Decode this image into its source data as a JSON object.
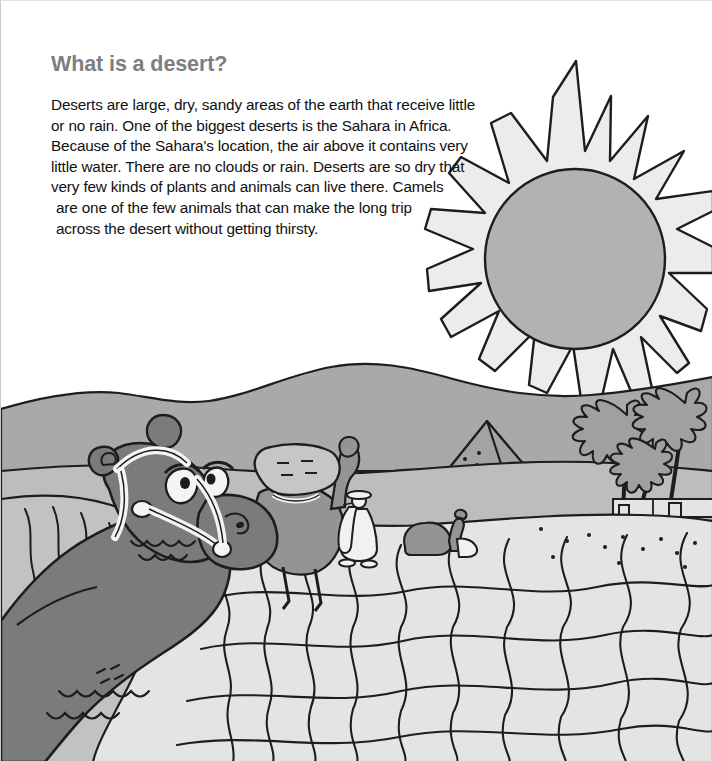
{
  "page": {
    "width": 712,
    "height": 761,
    "background": "#ffffff",
    "kind": "illustrated-book-page",
    "title": "What is a desert?"
  },
  "heading": {
    "text": "What is a desert?",
    "color": "#7e7e7e",
    "weight": "bold"
  },
  "body": {
    "color": "#111111",
    "lines": [
      "Deserts are large, dry, sandy areas of the earth that receive little",
      "or no rain. One of the biggest deserts is the Sahara in Africa.",
      "Because of the Sahara's location, the air above it contains very",
      "little water. There are no clouds or rain. Deserts are so dry that",
      "very few kinds of plants and animals can live there. Camels",
      "are one of the few animals that can make the long trip",
      "across the desert without getting thirsty."
    ],
    "paragraph": "Deserts are large, dry, sandy areas of the earth that receive little or no rain. One of the biggest deserts is the Sahara in Africa. Because of the Sahara's location, the air above it contains very little water. There are no clouds or rain. Deserts are so dry that very few kinds of plants and animals can live there. Camels are one of the few animals that can make the long trip across the desert without getting thirsty."
  },
  "illustration": {
    "description": "Cartoon desert scene with a large camel head in the foreground, a caravan, a pyramid, palm trees and a blazing sun",
    "palette": {
      "sky": "#ffffff",
      "sun_body": "#ececeb",
      "sun_disc": "#b2b2b2",
      "far_hills": "#a9a9a9",
      "mid_hills": "#bdbdbd",
      "sand_light": "#d6d6d4",
      "sand_pale": "#e4e4e2",
      "dune_shadow": "#c2c2c0",
      "camel_dark": "#7b7b7b",
      "camel_mid": "#949494",
      "camel_load": "#c6c6c4",
      "pyramid": "#a3a3a3",
      "palm": "#a0a0a0",
      "robe_white": "#f1f1ef",
      "outline": "#1d1d1d"
    },
    "elements": [
      {
        "name": "sun",
        "label": "Sun with flame rays",
        "rays": 14
      },
      {
        "name": "far-hills",
        "label": "Distant desert hills"
      },
      {
        "name": "pyramid",
        "label": "Pyramid"
      },
      {
        "name": "palm-trees",
        "label": "Palm trees",
        "count": 3
      },
      {
        "name": "oasis-buildings",
        "label": "Low desert buildings"
      },
      {
        "name": "foreground-camel",
        "label": "Large camel head with bridle"
      },
      {
        "name": "pack-camel",
        "label": "Standing camel carrying a load"
      },
      {
        "name": "resting-camel",
        "label": "Resting camel"
      },
      {
        "name": "robed-traveller",
        "label": "Traveller in white robe and hat"
      },
      {
        "name": "sand-ripples",
        "label": "Wavy sand ripple lines"
      }
    ]
  }
}
